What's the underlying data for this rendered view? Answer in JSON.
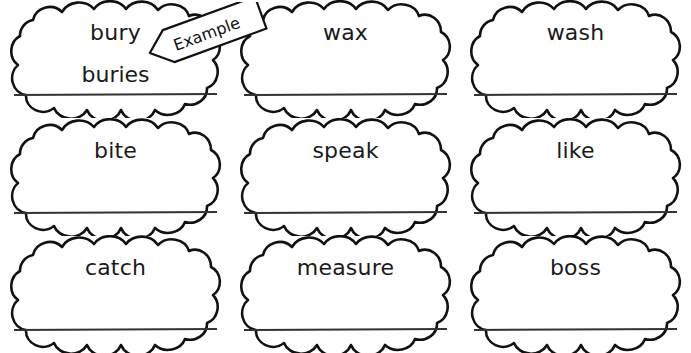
{
  "worksheet": {
    "title": "Verb Tense Cloud Worksheet",
    "example_label": "Example",
    "clouds": [
      {
        "word": "bury",
        "answer": "buries",
        "row": 1,
        "col": 1
      },
      {
        "word": "wax",
        "answer": "",
        "row": 1,
        "col": 2
      },
      {
        "word": "wash",
        "answer": "",
        "row": 1,
        "col": 3
      },
      {
        "word": "bite",
        "answer": "",
        "row": 2,
        "col": 1
      },
      {
        "word": "speak",
        "answer": "",
        "row": 2,
        "col": 2
      },
      {
        "word": "like",
        "answer": "",
        "row": 2,
        "col": 3
      },
      {
        "word": "catch",
        "answer": "",
        "row": 3,
        "col": 1
      },
      {
        "word": "measure",
        "answer": "",
        "row": 3,
        "col": 2
      },
      {
        "word": "boss",
        "answer": "",
        "row": 3,
        "col": 3
      }
    ],
    "colors": {
      "ink": "#111111",
      "paper": "#ffffff",
      "line": "#333333"
    }
  }
}
